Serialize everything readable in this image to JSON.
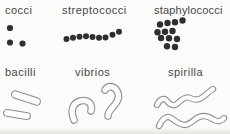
{
  "panels": [
    {
      "label": "cocci"
    },
    {
      "label": "streptococci"
    },
    {
      "label": "staphylococci"
    },
    {
      "label": "bacilli"
    },
    {
      "label": "vibrios"
    },
    {
      "label": "spirilla"
    }
  ],
  "colors": {
    "background": "#fbfbf9",
    "label_text": "#474747",
    "dot_fill": "#2f2f2f",
    "outline_stroke": "#8e8e8e",
    "shape_fill": "#fcfcfa"
  }
}
